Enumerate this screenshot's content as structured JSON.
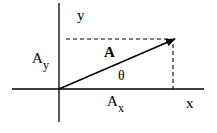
{
  "diagram": {
    "labels": {
      "y_axis": "y",
      "x_axis": "x",
      "vector": "A",
      "angle": "θ",
      "ay_main": "A",
      "ay_sub": "y",
      "ax_main": "A",
      "ax_sub": "x"
    },
    "colors": {
      "ink": "#000000",
      "background": "#ffffff"
    }
  }
}
